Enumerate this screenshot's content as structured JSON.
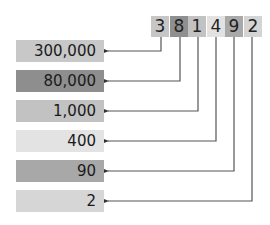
{
  "number": {
    "digits": [
      {
        "value": "3",
        "color": "#c6c6c6"
      },
      {
        "value": "8",
        "color": "#8f8f8f"
      },
      {
        "value": "1",
        "color": "#c2c2c2"
      },
      {
        "value": "4",
        "color": "#e2e2e2"
      },
      {
        "value": "9",
        "color": "#a9a9a9"
      },
      {
        "value": "2",
        "color": "#d4d4d4"
      }
    ]
  },
  "place_values": [
    {
      "label": "300,000",
      "color": "#c8c8c8"
    },
    {
      "label": "80,000",
      "color": "#8e8e8e"
    },
    {
      "label": "1,000",
      "color": "#c2c2c2"
    },
    {
      "label": "400",
      "color": "#e3e3e3"
    },
    {
      "label": "90",
      "color": "#a8a8a8"
    },
    {
      "label": "2",
      "color": "#d6d6d6"
    }
  ],
  "line_color": "#555555"
}
